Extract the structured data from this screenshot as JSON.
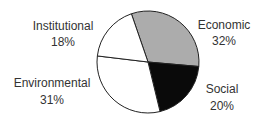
{
  "chart_data": {
    "type": "pie",
    "title": "",
    "start_angle_deg": -19,
    "direction": "clockwise",
    "slices": [
      {
        "label": "Economic",
        "value": 32,
        "pct_label": "32%",
        "color": "#acacac"
      },
      {
        "label": "Social",
        "value": 20,
        "pct_label": "20%",
        "color": "#0a0a0a"
      },
      {
        "label": "Environmental",
        "value": 31,
        "pct_label": "31%",
        "color": "#ffffff"
      },
      {
        "label": "Institutional",
        "value": 18,
        "pct_label": "18%",
        "color": "#ffffff"
      }
    ],
    "outline_color": "#222222"
  }
}
